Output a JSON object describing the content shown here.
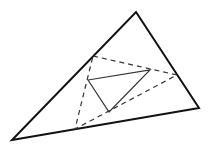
{
  "diagram": {
    "width": 211,
    "height": 149,
    "background": "#ffffff",
    "outer_triangle": {
      "points": "136,12 199,108 12,140",
      "stroke": "#111111",
      "stroke_width": 2
    },
    "dashed_triangle": {
      "points": "93,56 177,75 75,129",
      "stroke": "#333333",
      "stroke_width": 1.2,
      "dasharray": "5,4"
    },
    "inner_triangle": {
      "points": "88,80 150,70 109,112",
      "stroke": "#333333",
      "stroke_width": 1.2
    }
  }
}
